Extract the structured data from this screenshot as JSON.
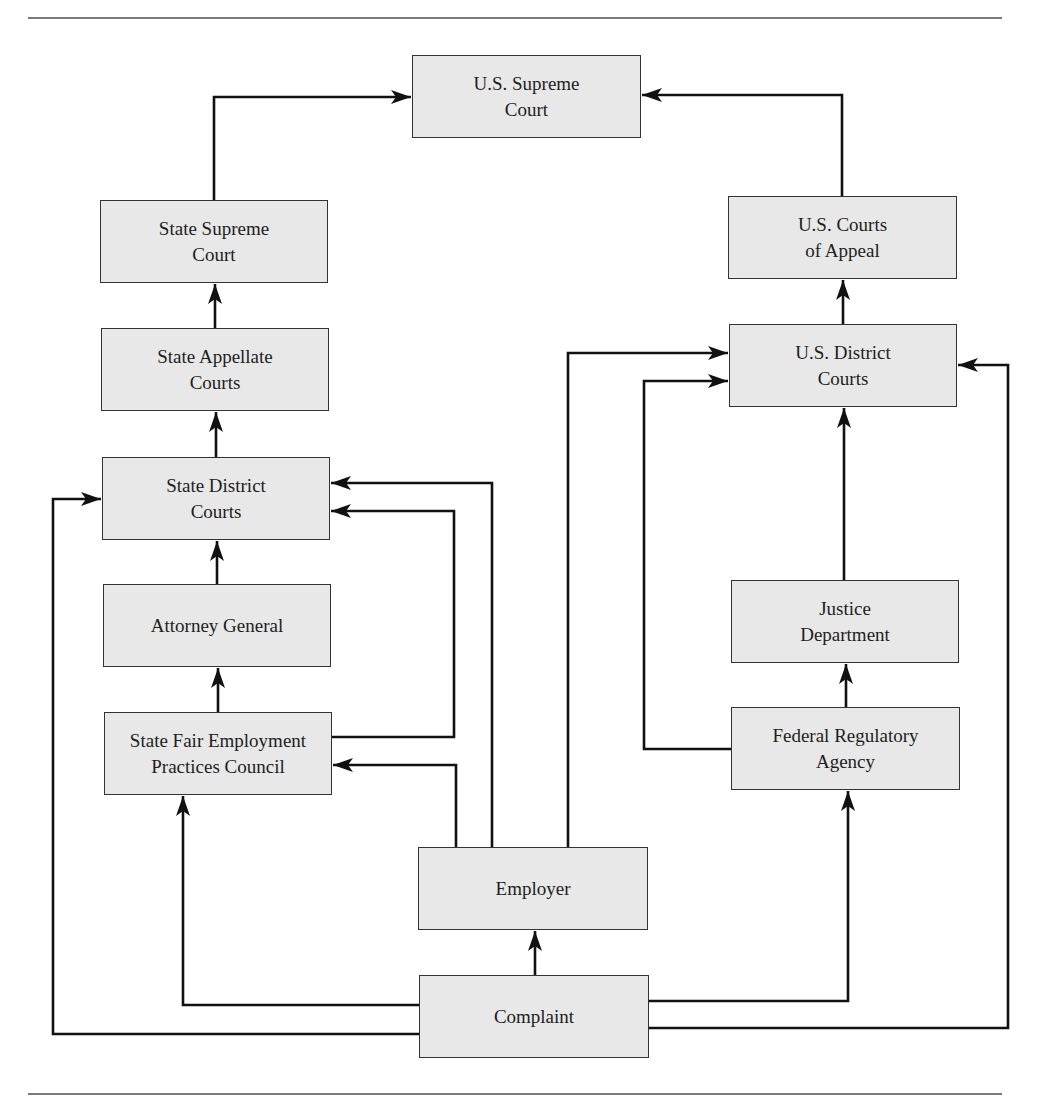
{
  "diagram": {
    "type": "flowchart",
    "nodes": {
      "us_supreme_court": {
        "line1": "U.S. Supreme",
        "line2": "Court"
      },
      "state_supreme_court": {
        "line1": "State Supreme",
        "line2": "Court"
      },
      "us_courts_of_appeal": {
        "line1": "U.S. Courts",
        "line2": "of Appeal"
      },
      "state_appellate_courts": {
        "line1": "State Appellate",
        "line2": "Courts"
      },
      "us_district_courts": {
        "line1": "U.S. District",
        "line2": "Courts"
      },
      "state_district_courts": {
        "line1": "State District",
        "line2": "Courts"
      },
      "attorney_general": {
        "line1": "Attorney General",
        "line2": ""
      },
      "justice_department": {
        "line1": "Justice",
        "line2": "Department"
      },
      "state_fepc": {
        "line1": "State Fair Employment",
        "line2": "Practices Council"
      },
      "federal_regulatory_agency": {
        "line1": "Federal Regulatory",
        "line2": "Agency"
      },
      "employer": {
        "line1": "Employer",
        "line2": ""
      },
      "complaint": {
        "line1": "Complaint",
        "line2": ""
      }
    },
    "edges": [
      {
        "from": "Complaint",
        "to": "Employer"
      },
      {
        "from": "Complaint",
        "to": "State Fair Employment Practices Council"
      },
      {
        "from": "Complaint",
        "to": "State District Courts"
      },
      {
        "from": "Complaint",
        "to": "Federal Regulatory Agency"
      },
      {
        "from": "Complaint",
        "to": "U.S. District Courts"
      },
      {
        "from": "Employer",
        "to": "State Fair Employment Practices Council"
      },
      {
        "from": "Employer",
        "to": "State District Courts"
      },
      {
        "from": "Employer",
        "to": "U.S. District Courts"
      },
      {
        "from": "State Fair Employment Practices Council",
        "to": "Attorney General"
      },
      {
        "from": "State Fair Employment Practices Council",
        "to": "State District Courts"
      },
      {
        "from": "Attorney General",
        "to": "State District Courts"
      },
      {
        "from": "State District Courts",
        "to": "State Appellate Courts"
      },
      {
        "from": "State Appellate Courts",
        "to": "State Supreme Court"
      },
      {
        "from": "State Supreme Court",
        "to": "U.S. Supreme Court"
      },
      {
        "from": "Federal Regulatory Agency",
        "to": "Justice Department"
      },
      {
        "from": "Federal Regulatory Agency",
        "to": "U.S. District Courts"
      },
      {
        "from": "Justice Department",
        "to": "U.S. District Courts"
      },
      {
        "from": "U.S. District Courts",
        "to": "U.S. Courts of Appeal"
      },
      {
        "from": "U.S. Courts of Appeal",
        "to": "U.S. Supreme Court"
      }
    ],
    "colors": {
      "box_fill": "#e8e8e8",
      "box_border": "#333333",
      "line": "#111111",
      "rule": "#7a7a7a"
    }
  }
}
